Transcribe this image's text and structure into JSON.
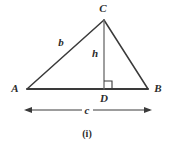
{
  "figure": {
    "caption": "(i)",
    "background_color": "#ffffff",
    "stroke_color": "#3a3a3a",
    "label_color": "#2b2b2b",
    "vertices": [
      {
        "name": "A",
        "label": "A",
        "x": 27,
        "y": 89,
        "label_x": 15,
        "label_y": 88
      },
      {
        "name": "B",
        "label": "B",
        "x": 148,
        "y": 89,
        "label_x": 158,
        "label_y": 88
      },
      {
        "name": "C",
        "label": "C",
        "x": 104,
        "y": 20,
        "label_x": 103,
        "label_y": 8
      },
      {
        "name": "D",
        "label": "D",
        "x": 104,
        "y": 89,
        "label_x": 104,
        "label_y": 98
      }
    ],
    "segments": [
      {
        "name": "side-ac",
        "x1": 27,
        "y1": 89,
        "x2": 104,
        "y2": 20
      },
      {
        "name": "side-cb",
        "x1": 104,
        "y1": 20,
        "x2": 148,
        "y2": 89
      },
      {
        "name": "side-ab",
        "x1": 27,
        "y1": 89,
        "x2": 148,
        "y2": 89
      },
      {
        "name": "altitude-cd",
        "x1": 104,
        "y1": 20,
        "x2": 104,
        "y2": 89
      }
    ],
    "side_labels": [
      {
        "name": "b",
        "label": "b",
        "x": 61,
        "y": 42
      },
      {
        "name": "h",
        "label": "h",
        "x": 95,
        "y": 53
      },
      {
        "name": "c",
        "label": "c",
        "x": 87,
        "y": 110
      }
    ],
    "right_angle": {
      "name": "right-angle-at-d",
      "x": 104,
      "y": 89,
      "size": 8,
      "direction": "right"
    },
    "dimension_arrow": {
      "name": "base-length-arrow",
      "label": "c",
      "x1": 24,
      "x2": 152,
      "y": 110
    }
  }
}
